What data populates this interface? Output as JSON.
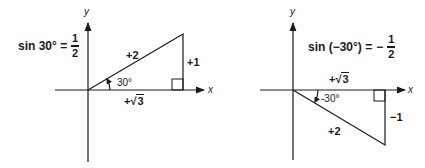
{
  "left_diagram": {
    "equation": {
      "lhs": "sin 30° =",
      "numerator": "1",
      "denominator": "2"
    },
    "axis_x": "x",
    "axis_y": "y",
    "hypotenuse": "+2",
    "opposite": "+1",
    "adjacent_prefix": "+",
    "adjacent_radicand": "3",
    "angle": "30°"
  },
  "right_diagram": {
    "equation": {
      "lhs": "sin (−30°) =",
      "sign": "−",
      "numerator": "1",
      "denominator": "2"
    },
    "axis_x": "x",
    "axis_y": "y",
    "hypotenuse": "+2",
    "opposite": "−1",
    "adjacent_prefix": "+",
    "adjacent_radicand": "3",
    "angle": "-30°"
  }
}
